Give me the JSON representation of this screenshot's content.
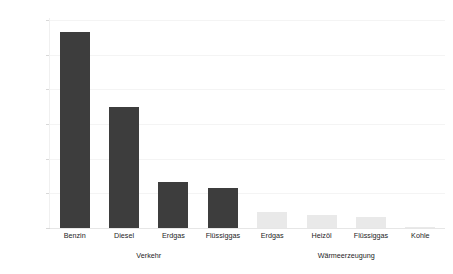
{
  "chart_data": {
    "type": "bar",
    "title": "",
    "subtitle": "",
    "xlabel": "",
    "ylabel": "Euro / t CO2",
    "ylim": [
      0,
      300
    ],
    "yticks": [
      0,
      50,
      100,
      150,
      200,
      250,
      300
    ],
    "ytick_labels": [
      "0",
      "50",
      "100",
      "150",
      "200",
      "250",
      "300"
    ],
    "grid": true,
    "legend": false,
    "legend_position": "none",
    "categories": [
      "Benzin",
      "Diesel",
      "Erdgas",
      "Flüssiggas",
      "Erdgas",
      "Heizöl",
      "Flüssiggas",
      "Kohle"
    ],
    "values": [
      283,
      175,
      67,
      58,
      23,
      19,
      16,
      1
    ],
    "bar_colors": [
      "#3d3d3d",
      "#3d3d3d",
      "#3d3d3d",
      "#3d3d3d",
      "#e9e9e9",
      "#e9e9e9",
      "#e9e9e9",
      "#e9e9e9"
    ],
    "groups": [
      {
        "label": "Verkehr",
        "start_index": 0,
        "end_index": 3
      },
      {
        "label": "Wärmeerzeugung",
        "start_index": 4,
        "end_index": 7
      }
    ],
    "annotations": []
  },
  "colors": {
    "dark_bar": "#3d3d3d",
    "light_bar": "#e9e9e9",
    "gridline": "#f4f4f4",
    "baseline": "#e6e6e6",
    "text": "#1d1d1d",
    "background": "#ffffff"
  }
}
